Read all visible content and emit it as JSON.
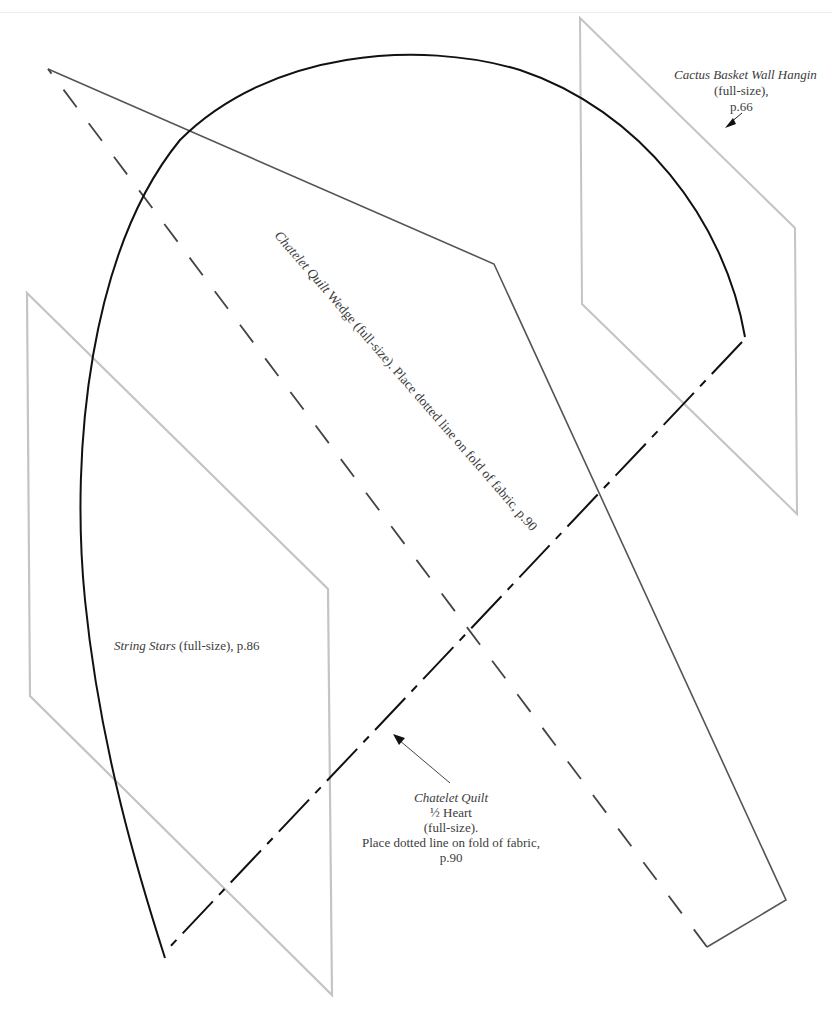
{
  "page": {
    "background": "#ffffff",
    "top_rule_color": "#ececec"
  },
  "colors": {
    "heart_outline": "#111111",
    "wedge_outline": "#555555",
    "gray_template": "#c4c4c4",
    "text": "#3c3c3c"
  },
  "templates": {
    "cactus": {
      "title": "Cactus Basket Wall Hangin",
      "size": "(full-size),",
      "page": "p.66",
      "points": [
        [
          580,
          18
        ],
        [
          795,
          228
        ],
        [
          797,
          514
        ],
        [
          582,
          304
        ]
      ]
    },
    "string_stars": {
      "title": "String Stars",
      "rest": " (full-size), p.86",
      "points": [
        [
          27,
          293
        ],
        [
          328,
          589
        ],
        [
          332,
          995
        ],
        [
          30,
          696
        ]
      ]
    },
    "wedge": {
      "title": "Chatelet Quilt",
      "rest": " Wedge (full-size). Place dotted line on fold of fabric, p.90",
      "solid_points": [
        [
          48,
          69
        ],
        [
          494,
          264
        ],
        [
          786,
          900
        ],
        [
          707,
          947
        ]
      ],
      "fold_line": [
        [
          707,
          947
        ],
        [
          48,
          69
        ]
      ]
    },
    "heart": {
      "title": "Chatelet Quilt",
      "line2": "½ Heart",
      "line3": "(full-size).",
      "line4": "Place dotted line on fold of fabric,",
      "line5": "p.90",
      "curve_start": [
        165,
        958
      ],
      "curve_end": [
        745,
        337
      ],
      "fold_line": [
        [
          742,
          342
        ],
        [
          165,
          952
        ]
      ]
    }
  },
  "icons": {
    "cactus_arrow": "arrow-down-left-icon",
    "heart_arrow": "arrow-up-left-icon"
  }
}
